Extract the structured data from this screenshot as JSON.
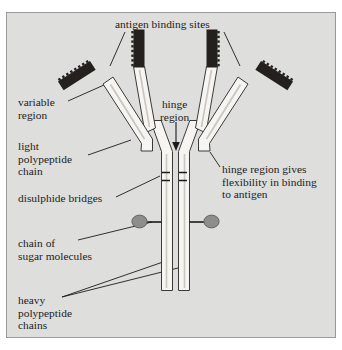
{
  "figure": {
    "panel_background": "#dededd",
    "panel_border": "#9a9a9a",
    "page_background": "#ffffff",
    "ink_color": "#1b1b1b",
    "variable_region_fill": "#23201d",
    "chain_fill": "#f6f5f1",
    "sugar_fill": "#8d8d8d"
  },
  "labels": {
    "antigen_binding_sites": "antigen binding sites",
    "variable_region": "variable\nregion",
    "light_polypeptide_chain": "light\npolypeptide\nchain",
    "hinge_region": "hinge\nregion",
    "disulphide_bridges": "disulphide bridges",
    "hinge_flexibility": "hinge region gives\nflexibility in binding\nto antigen",
    "chain_of_sugar_molecules": "chain of\nsugar molecules",
    "heavy_polypeptide_chains": "heavy\npolypeptide\nchains"
  },
  "structure": {
    "parts": [
      "light-chain-left",
      "light-chain-right",
      "heavy-chain-left",
      "heavy-chain-right",
      "variable-region-outer-left",
      "variable-region-outer-right",
      "variable-region-inner-left",
      "variable-region-inner-right",
      "disulphide-bridge-upper",
      "disulphide-bridge-lower",
      "sugar-chain-left",
      "sugar-chain-right"
    ],
    "disulphide_bridge_count": 2,
    "sugar_molecule_count": 2,
    "antigen_binding_site_count": 2
  }
}
